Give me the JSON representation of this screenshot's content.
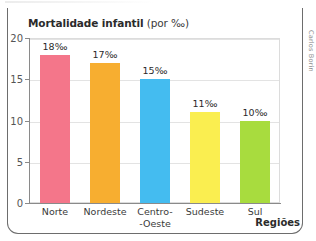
{
  "figure": {
    "credit": "Carlos Borin",
    "frame_color": "#6d6d6d"
  },
  "chart_data": {
    "type": "bar",
    "title": "Mortalidade infantil (por ‰)",
    "title_bold_part": "Mortalidade infantil",
    "title_normal_part": " (por ‰)",
    "xlabel": "Regiões",
    "ylabel": "",
    "ylim": [
      0,
      20
    ],
    "yticks": [
      0,
      5,
      10,
      15,
      20
    ],
    "ytick_labels": [
      "0",
      "5",
      "10",
      "15",
      "20"
    ],
    "grid": true,
    "legend": "none",
    "categories": [
      "Norte",
      "Nordeste",
      "Centro--Oeste",
      "Sudeste",
      "Sul"
    ],
    "category_lines": [
      [
        "Norte"
      ],
      [
        "Nordeste"
      ],
      [
        "Centro-",
        "-Oeste"
      ],
      [
        "Sudeste"
      ],
      [
        "Sul"
      ]
    ],
    "values": [
      18,
      17,
      15,
      11,
      10
    ],
    "data_labels": [
      "18‰",
      "17‰",
      "15‰",
      "11‰",
      "10‰"
    ],
    "colors": [
      "#F4768A",
      "#F7AE30",
      "#44BCF0",
      "#FAEE50",
      "#A8DC3E"
    ]
  }
}
